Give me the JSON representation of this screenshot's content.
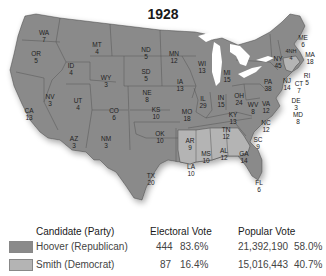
{
  "title": "1928",
  "colors": {
    "republican": "#8a8a8a",
    "democrat": "#b4b4b4",
    "border": "#444444",
    "lakes": "#ffffff"
  },
  "states": [
    {
      "abbr": "WA",
      "ev": "7",
      "party": "R"
    },
    {
      "abbr": "OR",
      "ev": "5",
      "party": "R"
    },
    {
      "abbr": "CA",
      "ev": "13",
      "party": "R"
    },
    {
      "abbr": "ID",
      "ev": "4",
      "party": "R"
    },
    {
      "abbr": "NV",
      "ev": "3",
      "party": "R"
    },
    {
      "abbr": "MT",
      "ev": "4",
      "party": "R"
    },
    {
      "abbr": "WY",
      "ev": "3",
      "party": "R"
    },
    {
      "abbr": "UT",
      "ev": "4",
      "party": "R"
    },
    {
      "abbr": "AZ",
      "ev": "3",
      "party": "R"
    },
    {
      "abbr": "CO",
      "ev": "6",
      "party": "R"
    },
    {
      "abbr": "NM",
      "ev": "3",
      "party": "R"
    },
    {
      "abbr": "ND",
      "ev": "5",
      "party": "R"
    },
    {
      "abbr": "SD",
      "ev": "5",
      "party": "R"
    },
    {
      "abbr": "NE",
      "ev": "8",
      "party": "R"
    },
    {
      "abbr": "KS",
      "ev": "10",
      "party": "R"
    },
    {
      "abbr": "OK",
      "ev": "10",
      "party": "R"
    },
    {
      "abbr": "TX",
      "ev": "20",
      "party": "R"
    },
    {
      "abbr": "MN",
      "ev": "12",
      "party": "R"
    },
    {
      "abbr": "IA",
      "ev": "13",
      "party": "R"
    },
    {
      "abbr": "MO",
      "ev": "18",
      "party": "R"
    },
    {
      "abbr": "AR",
      "ev": "9",
      "party": "D"
    },
    {
      "abbr": "LA",
      "ev": "10",
      "party": "D"
    },
    {
      "abbr": "WI",
      "ev": "13",
      "party": "R"
    },
    {
      "abbr": "IL",
      "ev": "29",
      "party": "R"
    },
    {
      "abbr": "MI",
      "ev": "15",
      "party": "R"
    },
    {
      "abbr": "IN",
      "ev": "15",
      "party": "R"
    },
    {
      "abbr": "OH",
      "ev": "24",
      "party": "R"
    },
    {
      "abbr": "KY",
      "ev": "13",
      "party": "R"
    },
    {
      "abbr": "TN",
      "ev": "12",
      "party": "R"
    },
    {
      "abbr": "MS",
      "ev": "10",
      "party": "D"
    },
    {
      "abbr": "AL",
      "ev": "12",
      "party": "D"
    },
    {
      "abbr": "GA",
      "ev": "14",
      "party": "D"
    },
    {
      "abbr": "FL",
      "ev": "6",
      "party": "R"
    },
    {
      "abbr": "SC",
      "ev": "9",
      "party": "D"
    },
    {
      "abbr": "NC",
      "ev": "12",
      "party": "R"
    },
    {
      "abbr": "VA",
      "ev": "12",
      "party": "R"
    },
    {
      "abbr": "WV",
      "ev": "8",
      "party": "R"
    },
    {
      "abbr": "PA",
      "ev": "38",
      "party": "R"
    },
    {
      "abbr": "NY",
      "ev": "45",
      "party": "R"
    },
    {
      "abbr": "NJ",
      "ev": "14",
      "party": "R"
    },
    {
      "abbr": "DE",
      "ev": "3",
      "party": "R"
    },
    {
      "abbr": "MD",
      "ev": "8",
      "party": "R"
    },
    {
      "abbr": "CT",
      "ev": "7",
      "party": "R"
    },
    {
      "abbr": "RI",
      "ev": "5",
      "party": "D"
    },
    {
      "abbr": "MA",
      "ev": "18",
      "party": "D"
    },
    {
      "abbr": "VT",
      "ev": "4",
      "party": "R"
    },
    {
      "abbr": "NH",
      "ev": "4",
      "party": "R"
    },
    {
      "abbr": "ME",
      "ev": "6",
      "party": "R"
    }
  ],
  "legend": {
    "headers": {
      "candidate": "Candidate (Party)",
      "electoral": "Electoral Vote",
      "popular": "Popular Vote"
    },
    "rows": [
      {
        "candidate": "Hoover (Republican)",
        "ev": "444",
        "ev_pct": "83.6%",
        "pv": "21,392,190",
        "pv_pct": "58.0%",
        "color": "#8a8a8a"
      },
      {
        "candidate": "Smith (Democrat)",
        "ev": "87",
        "ev_pct": "16.4%",
        "pv": "15,016,443",
        "pv_pct": "40.7%",
        "color": "#b4b4b4"
      }
    ]
  }
}
